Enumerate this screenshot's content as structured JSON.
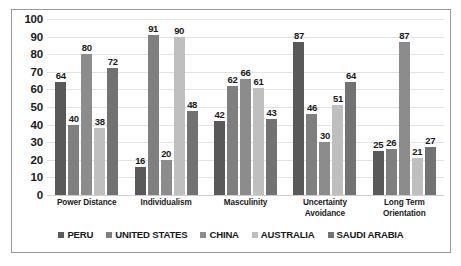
{
  "chart_data": {
    "type": "bar",
    "title": "",
    "xlabel": "",
    "ylabel": "",
    "ylim": [
      0,
      100
    ],
    "yticks": [
      100,
      90,
      80,
      70,
      60,
      50,
      40,
      30,
      20,
      10,
      0
    ],
    "grid": true,
    "legend_position": "bottom",
    "categories": [
      "Power Distance",
      "Individualism",
      "Masculinity",
      "Uncertainty\nAvoidance",
      "Long Term\nOrientation"
    ],
    "series": [
      {
        "name": "PERU",
        "color": "#595959",
        "values": [
          64,
          16,
          42,
          87,
          25
        ]
      },
      {
        "name": "UNITED STATES",
        "color": "#7f7f7f",
        "values": [
          40,
          91,
          62,
          46,
          26
        ]
      },
      {
        "name": "CHINA",
        "color": "#8c8c8c",
        "values": [
          80,
          20,
          66,
          30,
          87
        ]
      },
      {
        "name": "AUSTRALIA",
        "color": "#bfbfbf",
        "values": [
          38,
          90,
          61,
          51,
          21
        ]
      },
      {
        "name": "SAUDI ARABIA",
        "color": "#727272",
        "values": [
          72,
          48,
          43,
          64,
          27
        ]
      }
    ]
  },
  "colors": {
    "frame_border": "#9a9a9a",
    "gridline": "#e3e3e3",
    "text": "#1a1a1a",
    "background": "#ffffff"
  }
}
